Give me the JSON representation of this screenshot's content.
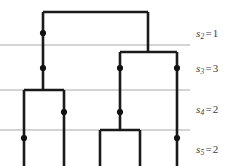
{
  "figure": {
    "type": "coalescent-tree-diagram",
    "width": 248,
    "height": 166,
    "background_color": "#ffffff",
    "branch_color": "#1a1a1a",
    "gridline_color": "#a9a9a9",
    "node_color": "#111111",
    "label_color": "#3c3c3c"
  },
  "levels": [
    {
      "id": "s2",
      "variable": "s",
      "subscript": "2",
      "equals": "=",
      "value": "1",
      "text": "s2 = 1",
      "gridline_y": 45
    },
    {
      "id": "s3",
      "variable": "s",
      "subscript": "3",
      "equals": "=",
      "value": "3",
      "text": "s3 = 3",
      "gridline_y": 90
    },
    {
      "id": "s4",
      "variable": "s",
      "subscript": "4",
      "equals": "=",
      "value": "2",
      "text": "s4 = 2",
      "gridline_y": 130
    },
    {
      "id": "s5",
      "variable": "s",
      "subscript": "5",
      "equals": "=",
      "value": "2",
      "text": "s5 = 2",
      "gridline_y": null
    }
  ],
  "gridlines": [
    {
      "name": "gridline-s2-s3",
      "y": 45,
      "x1": 0,
      "x2": 190
    },
    {
      "name": "gridline-s3-s4",
      "y": 90,
      "x1": 0,
      "x2": 190
    },
    {
      "name": "gridline-s4-s5",
      "y": 130,
      "x1": 0,
      "x2": 190
    }
  ],
  "leaves": [
    {
      "name": "leaf-1",
      "x": 24,
      "y_bottom": 166
    },
    {
      "name": "leaf-2",
      "x": 64,
      "y_bottom": 166
    },
    {
      "name": "leaf-3",
      "x": 100,
      "y_bottom": 166
    },
    {
      "name": "leaf-4",
      "x": 140,
      "y_bottom": 166
    },
    {
      "name": "leaf-5",
      "x": 177,
      "y_bottom": 166
    }
  ],
  "branches": [
    {
      "name": "root-crossbar",
      "points": "43,12 148,12"
    },
    {
      "name": "root-left-stem",
      "points": "43,12 43,90"
    },
    {
      "name": "root-right-stem",
      "points": "148,12 148,52"
    },
    {
      "name": "clade-right-crossbar",
      "points": "120,52 177,52"
    },
    {
      "name": "clade-right-left-stem",
      "points": "120,52 120,130"
    },
    {
      "name": "clade-right-right-stem",
      "points": "177,52 177,166"
    },
    {
      "name": "clade-left-crossbar",
      "points": "24,90 64,90"
    },
    {
      "name": "clade-left-left-stem",
      "points": "24,90 24,166"
    },
    {
      "name": "clade-left-right-stem",
      "points": "64,90 64,166"
    },
    {
      "name": "clade-bottom-crossbar",
      "points": "100,130 140,130"
    },
    {
      "name": "clade-bottom-left-stem",
      "points": "100,130 100,166"
    },
    {
      "name": "clade-bottom-right-stem",
      "points": "140,130 140,166"
    }
  ],
  "nodes": [
    {
      "name": "node-trunk-upper",
      "x": 43,
      "y": 33
    },
    {
      "name": "node-trunk-lower",
      "x": 43,
      "y": 68
    },
    {
      "name": "node-right-clade-left",
      "x": 120,
      "y": 68
    },
    {
      "name": "node-right-clade-right",
      "x": 177,
      "y": 68
    },
    {
      "name": "node-left-clade-right",
      "x": 64,
      "y": 112
    },
    {
      "name": "node-center-stem",
      "x": 120,
      "y": 112
    },
    {
      "name": "node-leaf1-mark",
      "x": 24,
      "y": 138
    },
    {
      "name": "node-leaf5-mark",
      "x": 177,
      "y": 138
    }
  ]
}
